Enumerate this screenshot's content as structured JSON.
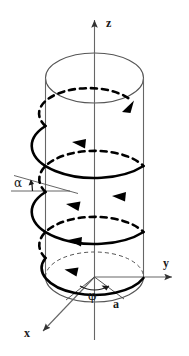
{
  "figure": {
    "type": "geometry-diagram",
    "width": 189,
    "height": 356,
    "background_color": "#ffffff",
    "stroke_color": "#1a1a1a",
    "axis_color": "#555555",
    "cylinder_color": "#555555"
  },
  "labels": {
    "z_axis": "z",
    "y_axis": "y",
    "x_axis": "x",
    "pitch_angle": "α",
    "azimuth_angle": "φ",
    "radius": "a"
  },
  "geometry": {
    "cylinder": {
      "center_x": 94.5,
      "top_center_y": 78,
      "bottom_center_y": 277,
      "radius_x": 49,
      "radius_y": 25,
      "left_edge_x": 45.5,
      "right_edge_x": 143.5
    },
    "axes": {
      "z": {
        "x1": 94.5,
        "y1": 340,
        "x2": 94.5,
        "y2": 14,
        "arrow": "up"
      },
      "y": {
        "x1": 94.5,
        "y1": 277,
        "x2": 178,
        "y2": 277,
        "arrow": "right"
      },
      "x": {
        "x1": 94.5,
        "y1": 277,
        "x2": 40,
        "y2": 334,
        "arrow": "down-left"
      }
    },
    "helix": {
      "turns": 2.25,
      "direction": "counter-clockwise-ascending",
      "solid_segments": "front-facing",
      "dashed_segments": "back-facing",
      "arrow_count": 6
    },
    "angle_alpha": {
      "vertex_x": 60,
      "horizontal_line": {
        "x1": 12,
        "y1": 190,
        "x2": 62,
        "y2": 190
      },
      "tangent_line": {
        "x1": 16,
        "y1": 178,
        "x2": 72,
        "y2": 192
      },
      "label_x": 18,
      "label_y": 186
    },
    "angle_phi": {
      "vertex_x": 94.5,
      "vertex_y": 277,
      "label_x": 90,
      "label_y": 297
    },
    "radius_label": {
      "x": 114,
      "y": 306
    }
  }
}
